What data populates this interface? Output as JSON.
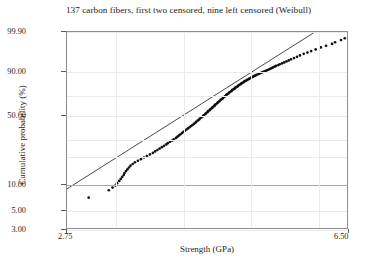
{
  "chart_data": {
    "type": "scatter",
    "title": "137 carbon fibers, first two censored, nine left censored (Weibull)",
    "xlabel": "Strength (GPa)",
    "ylabel": "Cumulative probability (%)",
    "plot_kind": "weibull-probability-plot",
    "grid": true,
    "legend": "none",
    "xlim": [
      2.75,
      6.5
    ],
    "ylim": [
      3.0,
      99.9
    ],
    "xticks": [
      2.75,
      6.5
    ],
    "xticklabels": [
      "2.75",
      "6.50"
    ],
    "yticks": [
      3.0,
      5.0,
      10.0,
      50.0,
      90.0,
      99.9
    ],
    "yticklabels": [
      "3.00",
      "5.00",
      "10.00",
      "50.00",
      "90.00",
      "99.90"
    ],
    "gridlines_y": [
      3.0,
      5.0,
      10.0,
      20.0,
      30.0,
      50.0,
      70.0,
      90.0,
      99.9
    ],
    "gridlines_x": [
      3.4,
      4.3,
      5.2,
      6.1
    ],
    "series": [
      {
        "name": "Weibull fit line",
        "type": "line",
        "color": "#1a1a1a",
        "x": [
          2.75,
          6.07
        ],
        "y": [
          8.6,
          99.9
        ]
      },
      {
        "name": "carbon fiber strength data",
        "type": "scatter",
        "color": "#111111",
        "marker": "filled-circle",
        "n_points": 137,
        "x": [
          3.04,
          3.31,
          3.36,
          3.4,
          3.42,
          3.45,
          3.47,
          3.49,
          3.51,
          3.52,
          3.54,
          3.56,
          3.58,
          3.6,
          3.63,
          3.66,
          3.7,
          3.74,
          3.78,
          3.82,
          3.86,
          3.9,
          3.93,
          3.96,
          3.99,
          4.02,
          4.05,
          4.08,
          4.1,
          4.13,
          4.16,
          4.18,
          4.21,
          4.23,
          4.25,
          4.27,
          4.29,
          4.31,
          4.33,
          4.35,
          4.37,
          4.39,
          4.41,
          4.43,
          4.45,
          4.47,
          4.48,
          4.5,
          4.52,
          4.53,
          4.55,
          4.57,
          4.58,
          4.6,
          4.61,
          4.63,
          4.64,
          4.66,
          4.67,
          4.69,
          4.7,
          4.72,
          4.73,
          4.74,
          4.76,
          4.77,
          4.79,
          4.8,
          4.81,
          4.83,
          4.84,
          4.85,
          4.87,
          4.88,
          4.89,
          4.91,
          4.92,
          4.93,
          4.95,
          4.96,
          4.97,
          4.99,
          5.0,
          5.01,
          5.03,
          5.04,
          5.05,
          5.07,
          5.08,
          5.09,
          5.11,
          5.12,
          5.13,
          5.15,
          5.16,
          5.18,
          5.19,
          5.21,
          5.22,
          5.24,
          5.25,
          5.27,
          5.28,
          5.3,
          5.32,
          5.33,
          5.35,
          5.37,
          5.39,
          5.41,
          5.43,
          5.45,
          5.47,
          5.49,
          5.51,
          5.53,
          5.55,
          5.58,
          5.6,
          5.63,
          5.66,
          5.69,
          5.72,
          5.75,
          5.79,
          5.83,
          5.87,
          5.92,
          5.97,
          6.02,
          6.08,
          6.15,
          6.22,
          6.3,
          6.34,
          6.42,
          6.47
        ],
        "y": [
          6.8,
          8.3,
          8.9,
          9.4,
          10.0,
          10.6,
          11.2,
          11.8,
          12.4,
          13.0,
          13.7,
          14.3,
          15.0,
          15.7,
          16.4,
          17.1,
          17.8,
          18.5,
          19.3,
          20.0,
          20.8,
          21.6,
          22.4,
          23.2,
          24.0,
          24.8,
          25.6,
          26.5,
          27.3,
          28.2,
          29.0,
          29.9,
          30.8,
          31.7,
          32.6,
          33.5,
          34.4,
          35.3,
          36.2,
          37.2,
          38.1,
          39.0,
          40.0,
          40.9,
          41.9,
          42.9,
          43.8,
          44.8,
          45.8,
          46.8,
          47.8,
          48.8,
          49.8,
          50.8,
          51.8,
          52.8,
          53.8,
          54.8,
          55.8,
          56.8,
          57.8,
          58.8,
          59.8,
          60.7,
          61.7,
          62.6,
          63.6,
          64.5,
          65.4,
          66.3,
          67.2,
          68.1,
          69.0,
          69.8,
          70.7,
          71.5,
          72.3,
          73.1,
          73.9,
          74.6,
          75.4,
          76.1,
          76.8,
          77.5,
          78.2,
          78.8,
          79.5,
          80.1,
          80.7,
          81.3,
          81.9,
          82.4,
          83.0,
          83.5,
          84.0,
          84.5,
          85.0,
          85.5,
          86.0,
          86.4,
          86.9,
          87.3,
          87.7,
          88.1,
          88.5,
          88.9,
          89.3,
          89.7,
          90.1,
          90.5,
          90.9,
          91.3,
          91.7,
          92.1,
          92.5,
          92.9,
          93.3,
          93.7,
          94.1,
          94.5,
          94.9,
          95.3,
          95.7,
          96.1,
          96.5,
          96.9,
          97.3,
          97.7,
          98.0,
          98.3,
          98.6,
          98.9,
          99.1,
          99.3,
          99.45,
          99.6,
          99.7
        ]
      }
    ],
    "annotations": [
      {
        "text": "nine left censored points form the low vertical cluster"
      },
      {
        "text": "two high-strength outliers lie above the fitted line near the upper right"
      }
    ]
  }
}
